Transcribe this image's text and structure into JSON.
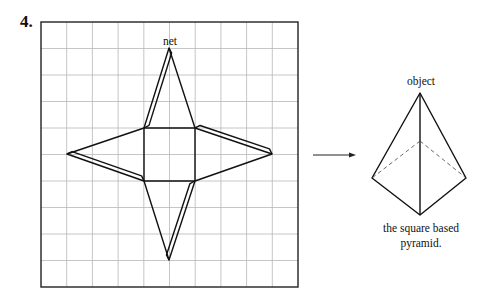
{
  "question_number": "4.",
  "net": {
    "label": "net",
    "grid": {
      "cols": 10,
      "rows": 10,
      "x0": 41,
      "y0": 22,
      "x1": 298,
      "y1": 287,
      "grid_color": "#b8b8b8",
      "frame_color": "#222222"
    },
    "square": {
      "x0": 144,
      "y0": 128,
      "x1": 195,
      "y1": 181
    },
    "apexes": {
      "top": [
        169,
        48
      ],
      "bottom": [
        169,
        260
      ],
      "left": [
        67,
        154
      ],
      "right": [
        272,
        154
      ]
    }
  },
  "arrow": {
    "x0": 313,
    "x1": 356,
    "y": 155
  },
  "object": {
    "label": "object",
    "apex": [
      420,
      93
    ],
    "left": [
      372,
      178
    ],
    "right": [
      466,
      178
    ],
    "front": [
      420,
      215
    ],
    "back": [
      420,
      141
    ]
  },
  "caption": {
    "line1": "the square based",
    "line2": "pyramid."
  }
}
